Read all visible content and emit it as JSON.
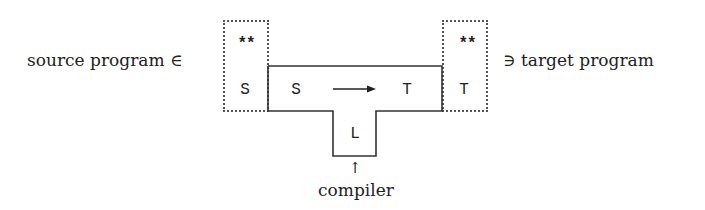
{
  "diagram": {
    "type": "T-diagram (compiler tombstone)",
    "left_label": "source program ∈",
    "right_label": "∋ target program",
    "bottom_label": "compiler",
    "bottom_arrow": "↑",
    "source_box": {
      "top": "**",
      "bottom": "S"
    },
    "target_box": {
      "top": "**",
      "bottom": "T"
    },
    "compiler": {
      "source_lang": "S",
      "target_lang": "T",
      "impl_lang": "L",
      "arrow": "→"
    },
    "colors": {
      "line": "#333333",
      "dotted": "#555555",
      "text": "#222222"
    }
  }
}
